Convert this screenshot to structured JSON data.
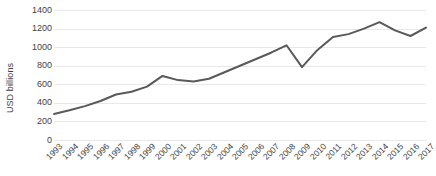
{
  "chart_data": {
    "type": "line",
    "title": "",
    "xlabel": "",
    "ylabel": "USD billions",
    "ylim": [
      0,
      1400
    ],
    "ytick_values": [
      1400,
      1200,
      1000,
      800,
      600,
      400,
      200,
      0
    ],
    "ytick_labels": [
      "1400",
      "1200",
      "1000",
      "800",
      "600",
      "400",
      "200",
      "0"
    ],
    "grid": true,
    "legend": false,
    "legend_position": "none",
    "line_color": "#595959",
    "categories": [
      "1993",
      "1994",
      "1995",
      "1996",
      "1997",
      "1998",
      "1999",
      "2000",
      "2001",
      "2002",
      "2003",
      "2004",
      "2005",
      "2006",
      "2007",
      "2008",
      "2009",
      "2010",
      "2011",
      "2012",
      "2013",
      "2014",
      "2015",
      "2016",
      "2017"
    ],
    "values": [
      280,
      320,
      365,
      420,
      490,
      520,
      575,
      690,
      645,
      630,
      660,
      730,
      800,
      870,
      940,
      1020,
      785,
      970,
      1110,
      1140,
      1200,
      1270,
      1180,
      1120,
      1210
    ],
    "series": [
      {
        "name": "USD billions",
        "values": [
          280,
          320,
          365,
          420,
          490,
          520,
          575,
          690,
          645,
          630,
          660,
          730,
          800,
          870,
          940,
          1020,
          785,
          970,
          1110,
          1140,
          1200,
          1270,
          1180,
          1120,
          1210
        ]
      }
    ]
  }
}
